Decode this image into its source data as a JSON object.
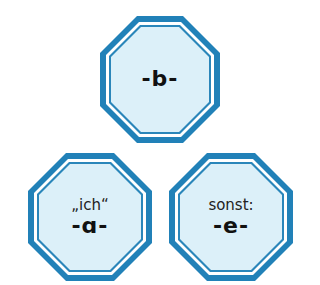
{
  "colors": {
    "outer_stroke": "#2181b8",
    "inner_stroke": "#2a86ba",
    "fill": "#dcf0f9",
    "gap": "#ffffff",
    "text": "#111111"
  },
  "octagons": [
    {
      "id": "top",
      "caption": "",
      "letter": "-b-"
    },
    {
      "id": "bottom-left",
      "caption": "„ich“",
      "letter": "-ɑ-"
    },
    {
      "id": "bottom-right",
      "caption": "sonst:",
      "letter": "-e-"
    }
  ]
}
